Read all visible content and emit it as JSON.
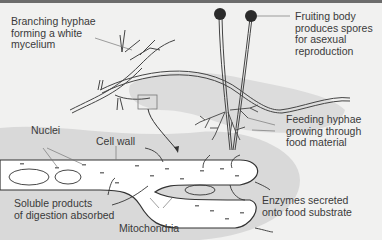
{
  "diagram": {
    "labels": {
      "branching": "Branching hyphae\nforming a white\nmycelium",
      "fruiting": "Fruiting body\nproduces spores\nfor asexual\nreproduction",
      "feeding": "Feeding hyphae\ngrowing through\nfood material",
      "nuclei": "Nuclei",
      "cell_wall": "Cell wall",
      "soluble": "Soluble products\nof digestion absorbed",
      "mitochondria": "Mitochondria",
      "enzymes": "Enzymes secreted\nonto food substrate"
    },
    "colors": {
      "background": "#f1f1f0",
      "food_substrate": "#d9d9d9",
      "hypha_fill": "#ffffff",
      "outline": "#333333",
      "spore_head": "#2b2b2b",
      "top_bar": "#6c6c6c"
    }
  }
}
